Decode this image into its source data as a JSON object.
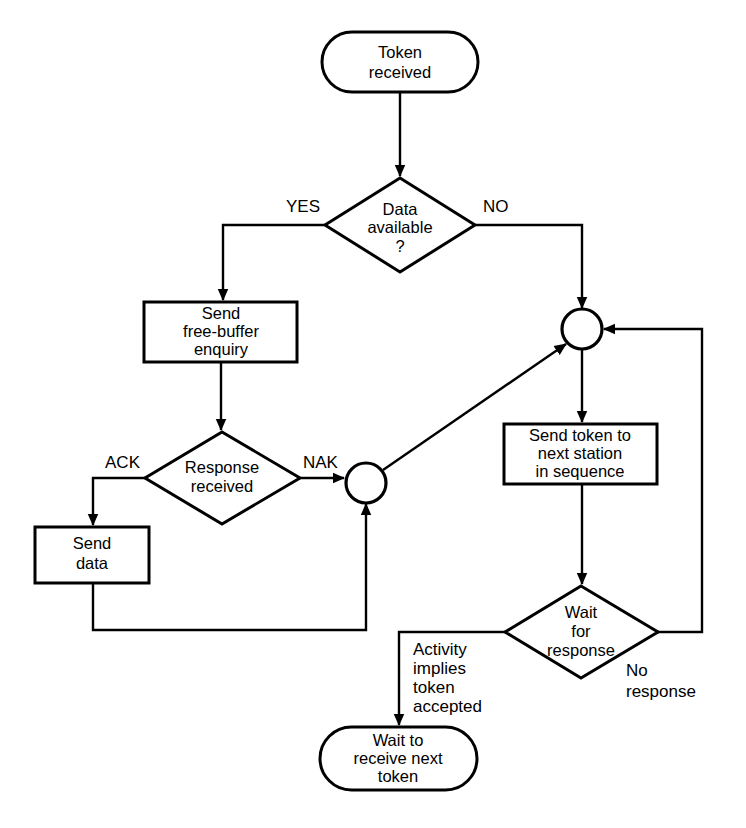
{
  "diagram": {
    "type": "flowchart",
    "background_color": "#ffffff",
    "line_color": "#000000"
  },
  "nodes": {
    "start_terminal": {
      "shape": "terminator",
      "line1": "Token",
      "line2": "received"
    },
    "data_available_decision": {
      "shape": "decision",
      "line1": "Data",
      "line2": "available",
      "line3": "?"
    },
    "send_free_buffer_enquiry": {
      "shape": "process",
      "line1": "Send",
      "line2": "free-buffer",
      "line3": "enquiry"
    },
    "response_received_decision": {
      "shape": "decision",
      "line1": "Response",
      "line2": "received"
    },
    "send_data": {
      "shape": "process",
      "line1": "Send",
      "line2": "data"
    },
    "send_token_next_station": {
      "shape": "process",
      "line1": "Send token to",
      "line2": "next station",
      "line3": "in sequence"
    },
    "wait_for_response_decision": {
      "shape": "decision",
      "line1": "Wait",
      "line2": "for",
      "line3": "response"
    },
    "end_terminal": {
      "shape": "terminator",
      "line1": "Wait to",
      "line2": "receive next",
      "line3": "token"
    },
    "junction_lower": {
      "shape": "connector-circle"
    },
    "junction_upper": {
      "shape": "connector-circle"
    }
  },
  "edge_labels": {
    "yes": "YES",
    "no": "NO",
    "ack": "ACK",
    "nak": "NAK",
    "activity_implies_l1": "Activity",
    "activity_implies_l2": "implies",
    "activity_implies_l3": "token",
    "activity_implies_l4": "accepted",
    "no_response_l1": "No",
    "no_response_l2": "response"
  }
}
